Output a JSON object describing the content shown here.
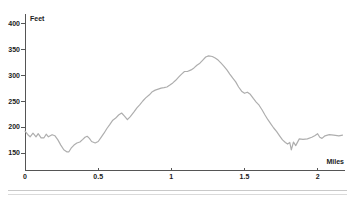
{
  "colors": {
    "background": "#ffffff",
    "curve": "#aeaeae",
    "axis": "#555555",
    "text": "#1a1a1a",
    "divider": "#cccccc"
  },
  "chart_data": {
    "type": "line",
    "title": "",
    "xlabel": "Miles",
    "ylabel": "Feet",
    "grid": false,
    "legend_position": "none",
    "xlim": [
      0,
      2.187
    ],
    "ylim": [
      117,
      416
    ],
    "x_ticks": [
      0,
      0.5,
      1,
      1.5,
      2
    ],
    "x_tick_labels": [
      "0",
      "0.5",
      "1",
      "1.5",
      "2"
    ],
    "y_ticks": [
      150,
      200,
      250,
      300,
      350,
      400
    ],
    "y_tick_labels": [
      "150",
      "200",
      "250",
      "300",
      "350",
      "400"
    ],
    "series": [
      {
        "name": "elevation-profile",
        "x": [
          0,
          0.02,
          0.035,
          0.055,
          0.075,
          0.09,
          0.11,
          0.13,
          0.145,
          0.16,
          0.185,
          0.205,
          0.225,
          0.245,
          0.265,
          0.285,
          0.3,
          0.315,
          0.335,
          0.355,
          0.375,
          0.395,
          0.41,
          0.425,
          0.44,
          0.455,
          0.48,
          0.5,
          0.52,
          0.54,
          0.56,
          0.58,
          0.6,
          0.62,
          0.64,
          0.66,
          0.68,
          0.7,
          0.72,
          0.745,
          0.765,
          0.785,
          0.805,
          0.825,
          0.85,
          0.87,
          0.89,
          0.91,
          0.93,
          0.95,
          0.97,
          0.99,
          1.01,
          1.03,
          1.05,
          1.07,
          1.09,
          1.11,
          1.135,
          1.155,
          1.175,
          1.195,
          1.215,
          1.235,
          1.255,
          1.28,
          1.3,
          1.32,
          1.34,
          1.36,
          1.38,
          1.4,
          1.42,
          1.44,
          1.46,
          1.48,
          1.5,
          1.52,
          1.54,
          1.56,
          1.58,
          1.6,
          1.62,
          1.64,
          1.66,
          1.68,
          1.7,
          1.72,
          1.74,
          1.76,
          1.78,
          1.795,
          1.81,
          1.82,
          1.835,
          1.85,
          1.875,
          1.9,
          1.93,
          1.96,
          1.98,
          2.0,
          2.015,
          2.03,
          2.05,
          2.08,
          2.11,
          2.145,
          2.17
        ],
        "y": [
          193,
          186,
          182,
          189,
          182,
          188,
          180,
          180,
          187,
          182,
          186,
          184,
          176,
          166,
          157,
          153,
          153,
          160,
          166,
          170,
          172,
          177,
          181,
          183,
          179,
          173,
          170,
          173,
          181,
          189,
          198,
          206,
          214,
          218,
          224,
          228,
          222,
          215,
          221,
          230,
          238,
          244,
          251,
          257,
          263,
          269,
          272,
          274,
          276,
          277,
          278,
          282,
          286,
          291,
          297,
          303,
          308,
          308,
          311,
          315,
          320,
          324,
          330,
          336,
          338,
          337,
          334,
          330,
          324,
          318,
          311,
          303,
          295,
          288,
          278,
          270,
          266,
          268,
          264,
          256,
          249,
          243,
          234,
          224,
          215,
          207,
          199,
          192,
          184,
          176,
          171,
          168,
          171,
          157,
          172,
          165,
          178,
          177,
          178,
          181,
          184,
          188,
          181,
          179,
          184,
          186,
          185,
          184,
          185
        ]
      }
    ]
  }
}
